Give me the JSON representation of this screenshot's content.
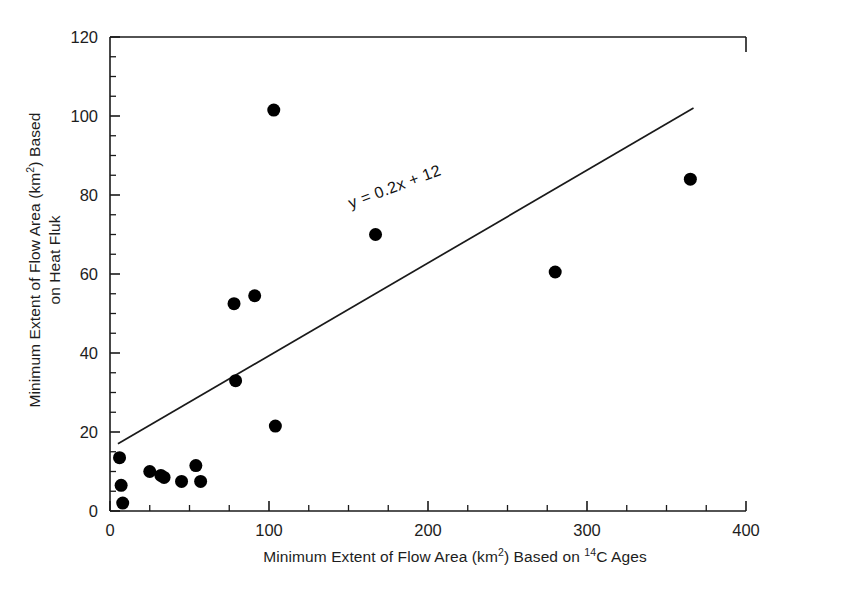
{
  "chart_data": {
    "type": "scatter",
    "title": "",
    "xlabel": "Minimum Extent of Flow Area (km2) Based on 14C Ages",
    "xlabel_parts": {
      "pre_sup2": "Minimum Extent of Flow Area (km",
      "sup2": "2",
      "mid": ") Based on ",
      "sup14": "14",
      "post": "C Ages"
    },
    "ylabel": "Minimum Extent of Flow Area (km2) Based on Heat Fluk",
    "ylabel_parts": {
      "line1_pre": "Minimum Extent of Flow Area (km",
      "line1_sup": "2",
      "line1_post": ") Based",
      "line2": "on Heat Fluk"
    },
    "xlim": [
      0,
      400
    ],
    "ylim": [
      0,
      120
    ],
    "xticks": [
      0,
      100,
      200,
      300,
      400
    ],
    "xtick_labels": [
      "0",
      "100",
      "200",
      "300",
      "400"
    ],
    "xminor_interval": 25,
    "yticks": [
      0,
      20,
      40,
      60,
      80,
      100,
      120
    ],
    "ytick_labels": [
      "0",
      "20",
      "40",
      "60",
      "80",
      "100",
      "120"
    ],
    "yminor_interval": 5,
    "grid": false,
    "legend": null,
    "marker": {
      "shape": "circle",
      "color": "#000000",
      "size_px": 13
    },
    "points": [
      {
        "x": 6,
        "y": 13.5
      },
      {
        "x": 7,
        "y": 6.5
      },
      {
        "x": 8,
        "y": 2.0
      },
      {
        "x": 25,
        "y": 10.0
      },
      {
        "x": 32,
        "y": 9.0
      },
      {
        "x": 34,
        "y": 8.5
      },
      {
        "x": 45,
        "y": 7.5
      },
      {
        "x": 54,
        "y": 11.5
      },
      {
        "x": 57,
        "y": 7.5
      },
      {
        "x": 78,
        "y": 52.5
      },
      {
        "x": 79,
        "y": 33.0
      },
      {
        "x": 91,
        "y": 54.5
      },
      {
        "x": 103,
        "y": 101.5
      },
      {
        "x": 104,
        "y": 21.5
      },
      {
        "x": 167,
        "y": 70.0
      },
      {
        "x": 280,
        "y": 60.5
      },
      {
        "x": 365,
        "y": 84.0
      }
    ],
    "trendline": {
      "equation_label": "y = 0.2x + 12",
      "slope": 0.2,
      "intercept": 12,
      "x_start": 5,
      "y_start": 17,
      "x_end": 367,
      "y_end": 102,
      "color": "#1a1a1a"
    },
    "annotations": [
      {
        "text": "y = 0.2x + 12",
        "x": 150,
        "y": 80,
        "rotation_deg": -20.5
      }
    ]
  }
}
